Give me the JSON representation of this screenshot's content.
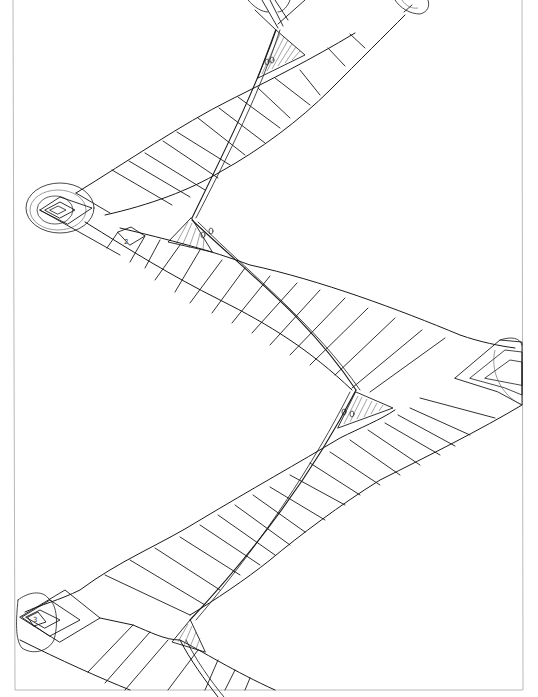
{
  "drawing": {
    "title": "Hand-drawn zigzag path sketch",
    "ink_color": "#1a1a1a",
    "frame_color": "#b8b8b8",
    "background": "#ffffff",
    "labels": {
      "square_bottom_left": "3",
      "square_upper_left": "2",
      "upper_band_mark": "1"
    },
    "nodes": [
      {
        "name": "node-top-center",
        "x": 270,
        "y": 5
      },
      {
        "name": "node-top-right",
        "x": 412,
        "y": 5
      },
      {
        "name": "node-left",
        "x": 62,
        "y": 210
      },
      {
        "name": "node-right",
        "x": 510,
        "y": 368
      },
      {
        "name": "node-bottom-left",
        "x": 36,
        "y": 622
      }
    ],
    "bands": [
      {
        "name": "band-1",
        "from": "node-top-right",
        "to": "node-left"
      },
      {
        "name": "band-2",
        "from": "node-left",
        "to": "node-right"
      },
      {
        "name": "band-3",
        "from": "node-right",
        "to": "node-bottom-left"
      },
      {
        "name": "band-4",
        "from": "node-bottom-left",
        "to": "bottom-edge"
      }
    ],
    "spine_crossings": [
      {
        "name": "crossing-1",
        "x": 278,
        "y": 32
      },
      {
        "name": "crossing-2",
        "x": 192,
        "y": 220
      },
      {
        "name": "crossing-3",
        "x": 356,
        "y": 390
      },
      {
        "name": "crossing-4",
        "x": 178,
        "y": 645
      }
    ]
  }
}
